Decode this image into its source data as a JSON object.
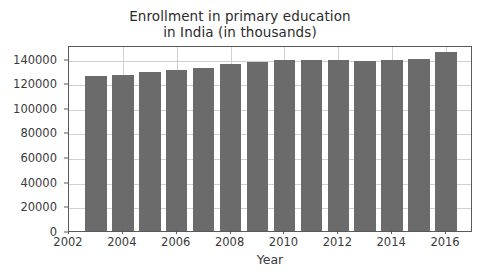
{
  "chart_data": {
    "type": "bar",
    "title": "Enrollment in primary education in India (in thousands)",
    "title_lines": [
      "Enrollment in primary education",
      "in India (in thousands)"
    ],
    "xlabel": "Year",
    "ylabel": "",
    "categories": [
      2003,
      2004,
      2005,
      2006,
      2007,
      2008,
      2009,
      2010,
      2011,
      2012,
      2013,
      2014,
      2015,
      2016
    ],
    "values": [
      125500,
      126800,
      129000,
      130500,
      132500,
      135500,
      137000,
      139000,
      139200,
      138500,
      138300,
      138500,
      139500,
      145500
    ],
    "xlim": [
      2002,
      2017
    ],
    "ylim": [
      0,
      151000
    ],
    "xticks": [
      2002,
      2004,
      2006,
      2008,
      2010,
      2012,
      2014,
      2016
    ],
    "xticklabels": [
      "2002",
      "2004",
      "2006",
      "2008",
      "2010",
      "2012",
      "2014",
      "2016"
    ],
    "yticks": [
      0,
      20000,
      40000,
      60000,
      80000,
      100000,
      120000,
      140000
    ],
    "yticklabels": [
      "0",
      "20000",
      "40000",
      "60000",
      "80000",
      "100000",
      "120000",
      "140000"
    ],
    "grid": true,
    "legend": null,
    "bar_color": "#6b6b6b",
    "grid_color": "#d0d0d0",
    "axes_color": "#5a5a5a",
    "background_color": "#ffffff",
    "text_color": "#3a3a3a",
    "bar_width_years": 0.8
  }
}
